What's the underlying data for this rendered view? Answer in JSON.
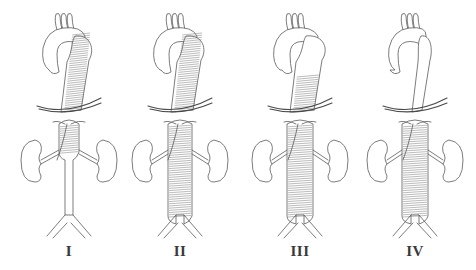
{
  "figure": {
    "panels": [
      {
        "id": "I",
        "label": "I",
        "center_x": 69,
        "aneurysm": {
          "thoracic_start": 30,
          "thoracic_end": 112,
          "abdominal_start": 122,
          "abdominal_end": 158
        },
        "thoracic_width": 20,
        "abdominal_width": 20
      },
      {
        "id": "II",
        "label": "II",
        "center_x": 180,
        "aneurysm": {
          "thoracic_start": 30,
          "thoracic_end": 112,
          "abdominal_start": 122,
          "abdominal_end": 222
        },
        "thoracic_width": 22,
        "abdominal_width": 24
      },
      {
        "id": "III",
        "label": "III",
        "center_x": 300,
        "aneurysm": {
          "thoracic_start": 72,
          "thoracic_end": 112,
          "abdominal_start": 122,
          "abdominal_end": 222
        },
        "thoracic_width": 24,
        "abdominal_width": 26
      },
      {
        "id": "IV",
        "label": "IV",
        "center_x": 415,
        "aneurysm": {
          "thoracic_start": null,
          "thoracic_end": null,
          "abdominal_start": 122,
          "abdominal_end": 222
        },
        "thoracic_width": 10,
        "abdominal_width": 26
      }
    ]
  },
  "colors": {
    "ink": "#5a5a5a",
    "label": "#3a3a3a",
    "background": "#ffffff"
  }
}
